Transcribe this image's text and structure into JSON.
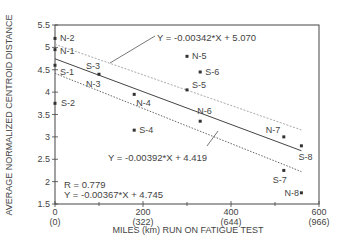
{
  "chart_data": {
    "type": "scatter",
    "title": "",
    "xlabel": "MILES (km) RUN ON FATIGUE TEST",
    "ylabel": "AVERAGE NORMALIZED CENTROID DISTANCE",
    "xlim": [
      0,
      600
    ],
    "ylim": [
      1.5,
      5.5
    ],
    "x_ticks": [
      {
        "value": 0,
        "label": "0",
        "sublabel": "(0)"
      },
      {
        "value": 200,
        "label": "200",
        "sublabel": "(322)"
      },
      {
        "value": 400,
        "label": "400",
        "sublabel": "(644)"
      },
      {
        "value": 600,
        "label": "600",
        "sublabel": "(966)"
      }
    ],
    "x_minor_ticks": [
      100,
      300,
      500
    ],
    "y_ticks": [
      {
        "value": 1.5,
        "label": "1.5"
      },
      {
        "value": 2,
        "label": "2"
      },
      {
        "value": 2.5,
        "label": "2.5"
      },
      {
        "value": 3,
        "label": "3"
      },
      {
        "value": 3.5,
        "label": "3.5"
      },
      {
        "value": 4,
        "label": "4"
      },
      {
        "value": 4.5,
        "label": "4.5"
      },
      {
        "value": 5,
        "label": "5"
      },
      {
        "value": 5.5,
        "label": "5.5"
      }
    ],
    "grid": false,
    "points": [
      {
        "label": "N-2",
        "x": 0,
        "y": 5.2
      },
      {
        "label": "N-1",
        "x": 0,
        "y": 4.95
      },
      {
        "label": "S-1",
        "x": 0,
        "y": 4.6
      },
      {
        "label": "S-2",
        "x": 0,
        "y": 3.75
      },
      {
        "label": "S-3",
        "x": 100,
        "y": 4.4
      },
      {
        "label": "N-3",
        "x": 100,
        "y": 4.4
      },
      {
        "label": "N-4",
        "x": 180,
        "y": 3.95
      },
      {
        "label": "S-4",
        "x": 180,
        "y": 3.15
      },
      {
        "label": "N-5",
        "x": 300,
        "y": 4.8
      },
      {
        "label": "S-6",
        "x": 330,
        "y": 4.45
      },
      {
        "label": "S-5",
        "x": 300,
        "y": 4.05
      },
      {
        "label": "N-6",
        "x": 330,
        "y": 3.35
      },
      {
        "label": "N-7",
        "x": 520,
        "y": 3.0
      },
      {
        "label": "S-8",
        "x": 560,
        "y": 2.8
      },
      {
        "label": "S-7",
        "x": 520,
        "y": 2.25
      },
      {
        "label": "N-8",
        "x": 560,
        "y": 1.75
      }
    ],
    "series": [
      {
        "name": "Y = -0.00342*X + 5.070",
        "slope": -0.00342,
        "intercept": 5.07,
        "style": "dotted-light",
        "x_range": [
          0,
          560
        ]
      },
      {
        "name": "Y = -0.00367*X + 4.745",
        "slope": -0.00367,
        "intercept": 4.745,
        "style": "solid",
        "x_range": [
          0,
          560
        ]
      },
      {
        "name": "Y = -0.00392*X + 4.419",
        "slope": -0.00392,
        "intercept": 4.419,
        "style": "dotted",
        "x_range": [
          0,
          560
        ]
      }
    ],
    "annotations": [
      {
        "text": "Y = -0.00342*X + 5.070",
        "position": "top-center"
      },
      {
        "text": "Y = -0.00392*X + 4.419",
        "position": "lower-center"
      },
      {
        "text": "R = 0.779",
        "position": "bottom-left"
      },
      {
        "text": "Y = -0.00367*X + 4.745",
        "position": "bottom-left"
      }
    ]
  },
  "labels": {
    "eq_upper": "Y = -0.00342*X + 5.070",
    "eq_lower": "Y = -0.00392*X + 4.419",
    "r_value": "R = 0.779",
    "eq_mid": "Y = -0.00367*X + 4.745",
    "xlabel": "MILES (km) RUN ON FATIGUE TEST",
    "ylabel": "AVERAGE NORMALIZED CENTROID DISTANCE"
  }
}
